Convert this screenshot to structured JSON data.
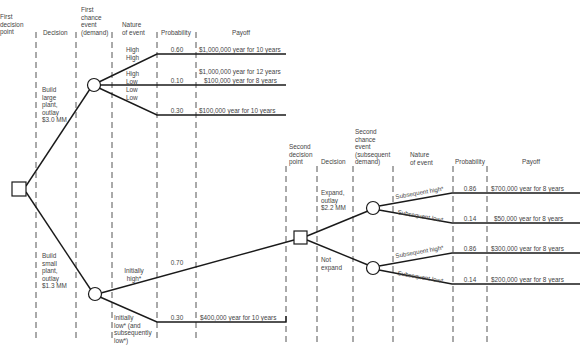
{
  "headers": {
    "first_decision_point": "First\ndecision\npoint",
    "decision_1": "Decision",
    "first_chance_event": "First\nchance\nevent\n(demand)",
    "nature_of_event_1": "Nature\nof event",
    "probability_1": "Probability",
    "payoff_1": "Payoff",
    "second_decision_point": "Second\ndecision\npoint",
    "decision_2": "Decision",
    "second_chance_event": "Second\nchance\nevent\n(subsequent\ndemand)",
    "nature_of_event_2": "Nature\nof event",
    "probability_2": "Probability",
    "payoff_2": "Payoff"
  },
  "decisions": {
    "build_large": "Build\nlarge\nplant,\noutlay\n$3.0 MM",
    "build_small": "Build\nsmall\nplant,\noutlay\n$1.3 MM",
    "expand": "Expand,\noutlay\n$2.2 MM",
    "not_expand": "Not\nexpand"
  },
  "large_plant_branches": [
    {
      "nature": "High\nHigh",
      "probability": "0.60",
      "payoff": "$1,000,000 year for 10 years"
    },
    {
      "nature": "High\nLow",
      "probability": "0.10",
      "payoff_top": "$1,000,000 year for 12 years",
      "payoff": "$100,000 year for 8 years"
    },
    {
      "nature": "Low\nLow",
      "probability": "0.30",
      "payoff": "$100,000 year for 10 years"
    }
  ],
  "small_plant_branches": [
    {
      "nature": "Initially\nhigh*",
      "probability": "0.70"
    },
    {
      "nature": "Initially\nlow* (and\nsubsequently\nlow*)",
      "probability": "0.30",
      "payoff": "$400,000 year for 10 years"
    }
  ],
  "expand_branches": [
    {
      "nature": "Subsequent high*",
      "probability": "0.86",
      "payoff": "$700,000 year for 8 years"
    },
    {
      "nature": "Subsequent low*",
      "probability": "0.14",
      "payoff": "$50,000 year for 8 years"
    }
  ],
  "not_expand_branches": [
    {
      "nature": "Subsequent high*",
      "probability": "0.86",
      "payoff": "$300,000 year for 8 years"
    },
    {
      "nature": "Subsequent low*",
      "probability": "0.14",
      "payoff": "$200,000 year for 8 years"
    }
  ],
  "colors": {
    "line": "#1a1a1a",
    "dash": "#555555",
    "text": "#444444"
  }
}
